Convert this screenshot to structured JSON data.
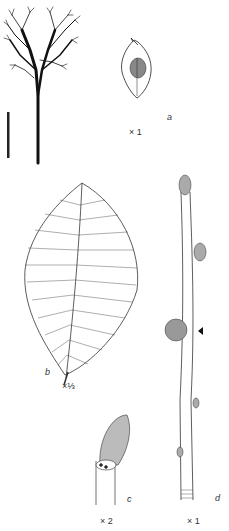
{
  "figure": {
    "panels": [
      {
        "id": "tree",
        "description": "tree silhouette"
      },
      {
        "id": "a",
        "letter": "a",
        "scale": "× 1",
        "description": "winged fruit (samara)"
      },
      {
        "id": "b",
        "letter": "b",
        "scale": "×⅓",
        "description": "leaf"
      },
      {
        "id": "c",
        "letter": "c",
        "scale": "× 2",
        "description": "bud close-up"
      },
      {
        "id": "d",
        "letter": "d",
        "scale": "× 1",
        "description": "twig with buds"
      }
    ],
    "scale_bar": {
      "description": "vertical scale bar"
    },
    "pointer": {
      "description": "triangle arrow pointing to bud"
    }
  }
}
